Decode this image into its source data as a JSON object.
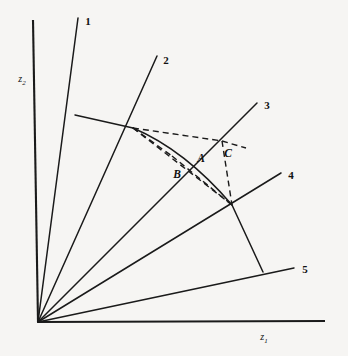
{
  "figure": {
    "background_color": "#f6f5f3",
    "line_color": "#1a1a1a"
  },
  "axes": {
    "x_label": "z",
    "x_label_sub": "1",
    "y_label": "z",
    "y_label_sub": "2",
    "origin": {
      "x": 38,
      "y": 322
    },
    "x_end": {
      "x": 325,
      "y": 321
    },
    "y_end": {
      "x": 33,
      "y": 20
    }
  },
  "rays": [
    {
      "label": "1",
      "label_x": 90,
      "label_y": 22,
      "end_x": 78,
      "end_y": 18
    },
    {
      "label": "2",
      "label_x": 167,
      "label_y": 61,
      "end_x": 157,
      "end_y": 56
    },
    {
      "label": "3",
      "label_x": 268,
      "label_y": 106,
      "end_x": 257,
      "end_y": 103
    },
    {
      "label": "4",
      "label_x": 292,
      "label_y": 176,
      "end_x": 281,
      "end_y": 173
    },
    {
      "label": "5",
      "label_x": 306,
      "label_y": 270,
      "end_x": 294,
      "end_y": 268
    }
  ],
  "points": [
    {
      "label": "A",
      "x": 201,
      "y": 159
    },
    {
      "label": "B",
      "x": 178,
      "y": 175
    },
    {
      "label": "C",
      "x": 228,
      "y": 155
    }
  ],
  "solid_segments": {
    "ray1_vertex": {
      "x": 75,
      "y": 115
    },
    "ray2_vertex": {
      "x": 133,
      "y": 128
    },
    "ray4_vertex": {
      "x": 232,
      "y": 205
    },
    "ray5_vertex": {
      "x": 263,
      "y": 272
    },
    "arc_control": {
      "x": 175,
      "y": 150
    }
  },
  "dashed_segments": {
    "apex": {
      "x": 133,
      "y": 128
    },
    "upper_node": {
      "x": 222,
      "y": 141
    },
    "c_tail": {
      "x": 245,
      "y": 148
    },
    "lower_node": {
      "x": 232,
      "y": 205
    },
    "b_node": {
      "x": 172,
      "y": 156
    }
  }
}
